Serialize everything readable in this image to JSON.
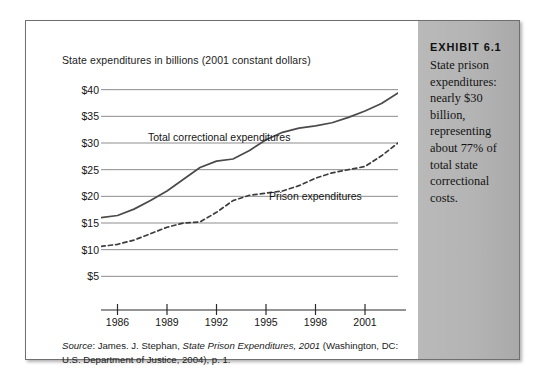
{
  "chart": {
    "title": "State expenditures in billions (2001 constant dollars)",
    "source_prefix": "Source",
    "source_text_1": ": James. J. Stephan, ",
    "source_italic": "State Prison Expenditures, 2001",
    "source_text_2": " (Washington, DC: U.S. Department of Justice, 2004), p. 1."
  },
  "sidebar": {
    "exhibit_number": "EXHIBIT 6.1",
    "caption": "State prison expenditures: nearly $30 billion, representing about 77% of total state correctional costs."
  },
  "chart_data": {
    "type": "line",
    "title": "State expenditures in billions (2001 constant dollars)",
    "xlabel": "",
    "ylabel": "State expenditures in billions (2001 constant dollars)",
    "xlim": [
      1985,
      2003
    ],
    "ylim": [
      0,
      42
    ],
    "yticks": [
      5,
      10,
      15,
      20,
      25,
      30,
      35,
      40
    ],
    "ytick_labels": [
      "$5",
      "$10",
      "$15",
      "$20",
      "$25",
      "$30",
      "$35",
      "$40"
    ],
    "xticks": [
      1986,
      1989,
      1992,
      1995,
      1998,
      2001
    ],
    "xtick_labels": [
      "1986",
      "1989",
      "1992",
      "1995",
      "1998",
      "2001"
    ],
    "grid": "horizontal",
    "legend": "inline-annotations",
    "series": [
      {
        "name": "Total correctional expenditures",
        "style": "solid",
        "color": "#4a4a4a",
        "x": [
          1985,
          1986,
          1987,
          1988,
          1989,
          1990,
          1991,
          1992,
          1993,
          1994,
          1995,
          1996,
          1997,
          1998,
          1999,
          2000,
          2001,
          2002,
          2003
        ],
        "values": [
          16.0,
          16.4,
          17.6,
          19.2,
          21.0,
          23.2,
          25.4,
          26.6,
          27.0,
          28.6,
          30.6,
          32.0,
          32.8,
          33.2,
          33.8,
          34.8,
          36.0,
          37.4,
          39.4
        ]
      },
      {
        "name": "Prison expenditures",
        "style": "dashed",
        "color": "#3d3d3d",
        "x": [
          1985,
          1986,
          1987,
          1988,
          1989,
          1990,
          1991,
          1992,
          1993,
          1994,
          1995,
          1996,
          1997,
          1998,
          1999,
          2000,
          2001,
          2002,
          2003
        ],
        "values": [
          10.6,
          11.0,
          11.8,
          13.0,
          14.2,
          15.0,
          15.2,
          17.0,
          19.2,
          20.2,
          20.6,
          21.0,
          22.0,
          23.4,
          24.4,
          25.0,
          25.6,
          27.6,
          30.0
        ]
      }
    ],
    "annotations": [
      {
        "text": "Total correctional expenditures",
        "series": "Total correctional expenditures"
      },
      {
        "text": "Prison expenditures",
        "series": "Prison expenditures"
      }
    ]
  }
}
